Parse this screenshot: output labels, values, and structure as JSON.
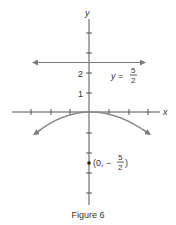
{
  "figure": {
    "caption": "Figure 6",
    "axes": {
      "x_label": "x",
      "y_label": "y",
      "y_tick_labels": [
        "1",
        "2"
      ]
    },
    "directrix": {
      "label_lhs": "y =",
      "num": "5",
      "den": "2",
      "equation": "y = 5/2",
      "y_value": 2.5
    },
    "focus": {
      "label_prefix": "(0, −",
      "num": "5",
      "den": "2",
      "label_suffix": ")",
      "point": [
        0,
        -2.5
      ]
    },
    "parabola": {
      "equation": "x^2 = -10y",
      "vertex": [
        0,
        0
      ],
      "opens": "down"
    },
    "colors": {
      "axis": "#555555",
      "curve": "#8a8a8a",
      "line": "#8a8a8a",
      "text": "#333333"
    }
  }
}
